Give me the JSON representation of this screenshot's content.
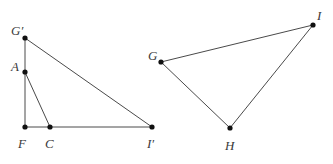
{
  "figure": {
    "type": "geometry-diagram",
    "canvas": {
      "width": 333,
      "height": 164,
      "background": "#ffffff"
    },
    "style": {
      "stroke_color": "#4a4a4a",
      "stroke_width": 1,
      "point_color": "#111111",
      "point_radius": 2.6,
      "label_color": "#3a3a3a",
      "label_font_size": 13
    },
    "shapes": [
      {
        "name": "left-figure",
        "points": [
          {
            "id": "Gprime",
            "label": "G′",
            "x": 25,
            "y": 38,
            "label_x": 11,
            "label_y": 24
          },
          {
            "id": "A",
            "label": "A",
            "x": 25,
            "y": 72,
            "label_x": 11,
            "label_y": 60
          },
          {
            "id": "F",
            "label": "F",
            "x": 25,
            "y": 127,
            "label_x": 18,
            "label_y": 137
          },
          {
            "id": "C",
            "label": "C",
            "x": 50,
            "y": 127,
            "label_x": 45,
            "label_y": 137
          },
          {
            "id": "Iprime",
            "label": "I′",
            "x": 152,
            "y": 127,
            "label_x": 147,
            "label_y": 137
          }
        ],
        "segments": [
          {
            "id": "seg-Gprime-F",
            "from": "Gprime",
            "to": "F"
          },
          {
            "id": "seg-Gprime-Iprime",
            "from": "Gprime",
            "to": "Iprime"
          },
          {
            "id": "seg-F-Iprime",
            "from": "F",
            "to": "Iprime"
          },
          {
            "id": "seg-A-C",
            "from": "A",
            "to": "C"
          }
        ]
      },
      {
        "name": "right-figure",
        "points": [
          {
            "id": "G",
            "label": "G",
            "x": 161,
            "y": 62,
            "label_x": 148,
            "label_y": 49
          },
          {
            "id": "I",
            "label": "I",
            "x": 313,
            "y": 25,
            "label_x": 317,
            "label_y": 9
          },
          {
            "id": "H",
            "label": "H",
            "x": 230,
            "y": 128,
            "label_x": 225,
            "label_y": 139
          }
        ],
        "segments": [
          {
            "id": "seg-G-I",
            "from": "G",
            "to": "I"
          },
          {
            "id": "seg-G-H",
            "from": "G",
            "to": "H"
          },
          {
            "id": "seg-H-I",
            "from": "H",
            "to": "I"
          }
        ]
      }
    ]
  }
}
